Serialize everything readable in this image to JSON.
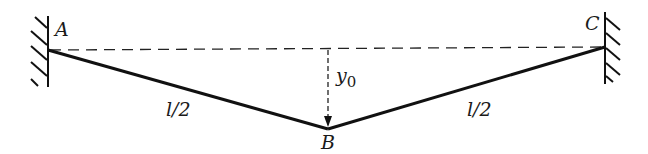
{
  "diagram": {
    "points": {
      "A": {
        "label": "A",
        "x": 48,
        "y": 50
      },
      "B": {
        "label": "B",
        "x": 328,
        "y": 129
      },
      "C": {
        "label": "C",
        "x": 604,
        "y": 47
      }
    },
    "segments": [
      {
        "from": "A",
        "to": "B",
        "label": "l/2",
        "style": "solid-thick"
      },
      {
        "from": "B",
        "to": "C",
        "label": "l/2",
        "style": "solid-thick"
      },
      {
        "from": "A",
        "to": "C",
        "style": "dashed"
      }
    ],
    "displacement": {
      "label_main": "y",
      "label_sub": "0",
      "direction": "down"
    },
    "supports": [
      "left-wall-hatched",
      "right-wall-hatched"
    ],
    "colors": {
      "line": "#111111",
      "background": "#ffffff"
    }
  }
}
